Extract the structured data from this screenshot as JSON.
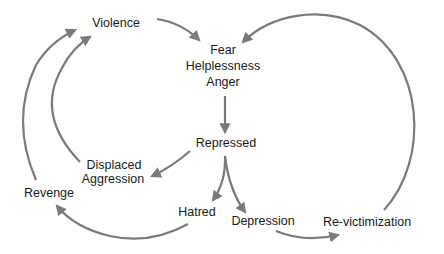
{
  "diagram": {
    "colors": {
      "arrow": "#7a7a7a",
      "text": "#1a1a1a",
      "background": "#ffffff"
    },
    "nodes": {
      "violence": {
        "label": "Violence"
      },
      "fear": {
        "lines": [
          "Fear",
          "Helplessness",
          "Anger"
        ]
      },
      "repressed": {
        "label": "Repressed"
      },
      "displaced_aggression": {
        "lines": [
          "Displaced",
          "Aggression"
        ]
      },
      "revenge": {
        "label": "Revenge"
      },
      "hatred": {
        "label": "Hatred"
      },
      "depression": {
        "label": "Depression"
      },
      "revictimization": {
        "label": "Re-victimization"
      }
    },
    "edges": [
      {
        "from": "Violence",
        "to": "Fear/Helplessness/Anger"
      },
      {
        "from": "Fear/Helplessness/Anger",
        "to": "Repressed"
      },
      {
        "from": "Repressed",
        "to": "Displaced Aggression"
      },
      {
        "from": "Repressed",
        "to": "Hatred"
      },
      {
        "from": "Repressed",
        "to": "Depression"
      },
      {
        "from": "Displaced Aggression",
        "to": "Violence"
      },
      {
        "from": "Hatred",
        "to": "Revenge"
      },
      {
        "from": "Revenge",
        "to": "Violence"
      },
      {
        "from": "Depression",
        "to": "Re-victimization"
      },
      {
        "from": "Re-victimization",
        "to": "Fear/Helplessness/Anger"
      }
    ]
  }
}
